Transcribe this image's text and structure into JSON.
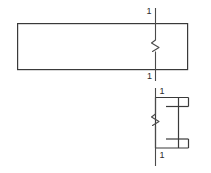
{
  "drawing": {
    "title": "Structural member elevation and section detail",
    "canvas": {
      "width": 211,
      "height": 173,
      "background": "#ffffff"
    },
    "stroke": {
      "color": "#3a3a3a",
      "thin_color": "#4a4a4a",
      "width_main": 1.2,
      "width_section": 1.0
    },
    "elevation_view": {
      "name": "elevation-rectangle",
      "x": 17,
      "y": 23,
      "width": 171,
      "height": 47
    },
    "section_line_upper": {
      "name": "section-cut-line-upper",
      "x": 155,
      "y_top": 8,
      "y_bottom": 81,
      "break_symbol": "zigzag",
      "break_center_y": 45,
      "label_top": "1",
      "label_bottom": "1"
    },
    "section_view": {
      "name": "channel-section",
      "web_x": 155,
      "web_top": 97,
      "web_bottom": 148,
      "flange_right_x": 188,
      "flange_upper_y": 105,
      "flange_lower_y": 140,
      "lip_length": 9,
      "inner_line_left_x": 166,
      "inner_upper_y": 110,
      "inner_lower_y": 135
    },
    "section_line_lower": {
      "name": "section-cut-line-lower",
      "x": 155,
      "y_top": 88,
      "y_bottom": 166,
      "break_symbol": "zigzag",
      "break_center_y": 119,
      "label_top": "1",
      "label_bottom": "1"
    },
    "labels": {
      "elev_top": "1",
      "elev_bottom": "1",
      "sect_top": "1",
      "sect_bottom": "1"
    }
  }
}
